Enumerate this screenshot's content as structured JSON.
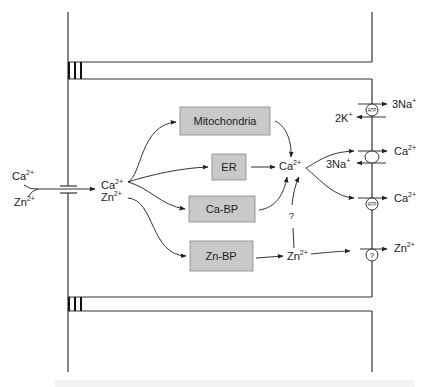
{
  "diagram": {
    "type": "cell-ion-transport",
    "colors": {
      "line": "#333333",
      "box_fill": "#c9c9c9",
      "box_border": "#888888",
      "background": "#ffffff"
    },
    "outside": {
      "ion_ca": "Ca",
      "ion_ca_charge": "2+",
      "ion_zn": "Zn",
      "ion_zn_charge": "2+"
    },
    "cytosol_entry": {
      "ion_ca": "Ca",
      "ion_ca_charge": "2+",
      "ion_zn": "Zn",
      "ion_zn_charge": "2+"
    },
    "boxes": [
      {
        "id": "mitochondria",
        "label": "Mitochondria"
      },
      {
        "id": "er",
        "label": "ER"
      },
      {
        "id": "ca-bp",
        "label": "Ca-BP"
      },
      {
        "id": "zn-bp",
        "label": "Zn-BP"
      }
    ],
    "central_pool": {
      "ca": "Ca",
      "ca_charge": "2+",
      "zn": "Zn",
      "zn_charge": "2+",
      "unknown_link": "?"
    },
    "transporters": [
      {
        "id": "na-k-atpase",
        "symbol": "ATP",
        "out_label": "3Na",
        "out_charge": "+",
        "in_label": "2K",
        "in_charge": "+"
      },
      {
        "id": "na-ca-exchanger",
        "symbol": "",
        "out_label": "Ca",
        "out_charge": "2+",
        "in_label": "3Na",
        "in_charge": "+"
      },
      {
        "id": "ca-atpase",
        "symbol": "ATP",
        "out_label": "Ca",
        "out_charge": "2+"
      },
      {
        "id": "zn-transporter",
        "symbol": "?",
        "out_label": "Zn",
        "out_charge": "2+"
      }
    ]
  }
}
